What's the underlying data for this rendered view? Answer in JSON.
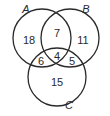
{
  "diagram": {
    "type": "venn-3",
    "sets": [
      {
        "name": "A",
        "label": "A"
      },
      {
        "name": "B",
        "label": "B"
      },
      {
        "name": "C",
        "label": "C"
      }
    ],
    "regions": {
      "A_only": "18",
      "B_only": "11",
      "C_only": "15",
      "A_and_B_only": "7",
      "A_and_C_only": "6",
      "B_and_C_only": "5",
      "A_and_B_and_C": "4"
    },
    "stroke_color": "#2a2a2a",
    "background": "#ffffff"
  }
}
